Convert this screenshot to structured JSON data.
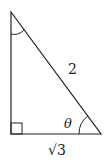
{
  "diagram": {
    "type": "right-triangle",
    "labels": {
      "hypotenuse": "2",
      "base": "√3",
      "angle": "θ"
    },
    "marks": [
      "right-angle-bottom-left",
      "angle-arc-top",
      "angle-arc-bottom-right"
    ],
    "colors": {
      "stroke": "#222222",
      "background": "#ffffff"
    }
  }
}
